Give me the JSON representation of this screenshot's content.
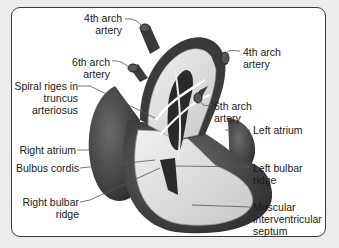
{
  "diagram": {
    "labels": {
      "fourth_arch_left": "4th arch\nartery",
      "fourth_arch_right": "4th arch\nartery",
      "sixth_arch_left": "6th arch\nartery",
      "sixth_arch_right": "6th arch\nartery",
      "spiral_ridges": "Spiral riges in\ntruncus\narteriosus",
      "right_atrium": "Right atrium",
      "bulbus_cordis": "Bulbus cordis",
      "right_bulbar_ridge": "Right bulbar\nridge",
      "left_atrium": "Left atrium",
      "left_bulbar_ridge": "Left bulbar\nridge",
      "muscular_septum": "Muscular\ninterventricular\nseptum"
    },
    "colors": {
      "background": "#ececec",
      "frame": "#ffffff",
      "border": "#3a3a3a",
      "heart_dark": "#3c3c3c",
      "heart_light": "#d8d8d8",
      "leader": "#555555"
    }
  }
}
